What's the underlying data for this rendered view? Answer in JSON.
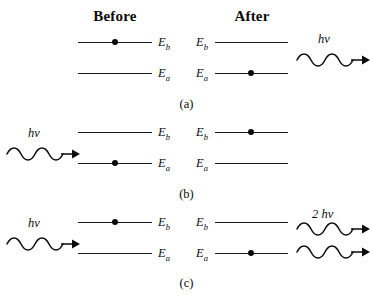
{
  "figure": {
    "headers": {
      "before": "Before",
      "after": "After"
    },
    "levels": {
      "upper": "E",
      "upper_sub": "b",
      "lower": "E",
      "lower_sub": "a"
    },
    "rows": [
      {
        "id": "a",
        "caption": "(a)",
        "process": "spontaneous-emission",
        "before": {
          "electron_level": "upper",
          "photon": null
        },
        "after": {
          "electron_level": "lower",
          "photon": {
            "label": "h",
            "label_symbol": "ν",
            "count": 1,
            "direction": "right",
            "position": "right"
          }
        }
      },
      {
        "id": "b",
        "caption": "(b)",
        "process": "absorption",
        "before": {
          "electron_level": "lower",
          "photon": {
            "label": "h",
            "label_symbol": "ν",
            "count": 1,
            "direction": "right",
            "position": "left"
          }
        },
        "after": {
          "electron_level": "upper",
          "photon": null
        }
      },
      {
        "id": "c",
        "caption": "(c)",
        "process": "stimulated-emission",
        "before": {
          "electron_level": "upper",
          "photon": {
            "label": "h",
            "label_symbol": "ν",
            "count": 1,
            "direction": "right",
            "position": "left"
          }
        },
        "after": {
          "electron_level": "lower",
          "photon": {
            "label": "2 h",
            "label_symbol": "ν",
            "count": 2,
            "direction": "right",
            "position": "right"
          }
        }
      }
    ],
    "colors": {
      "line": "#1b1b1b",
      "electron": "#0b0b0b",
      "text": "#0b0b0b",
      "background": "#ffffff"
    }
  }
}
